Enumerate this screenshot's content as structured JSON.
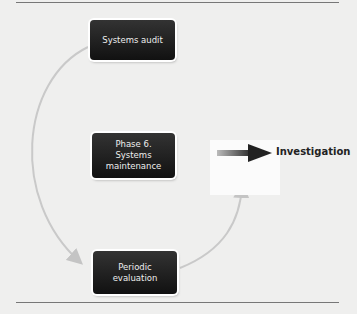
{
  "diagram": {
    "nodes": [
      {
        "id": "top",
        "label": "Systems audit"
      },
      {
        "id": "middle",
        "label": "Phase 6. Systems maintenance"
      },
      {
        "id": "bottom",
        "label": "Periodic evaluation"
      }
    ],
    "arrow_label": "Investigation",
    "colors": {
      "background": "#efefee",
      "box": "#1a1a1a",
      "connector": "#c9c9c9"
    }
  }
}
